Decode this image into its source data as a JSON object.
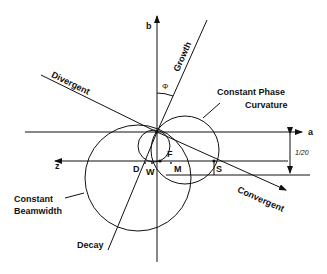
{
  "diagram": {
    "axes": {
      "b": "b",
      "a": "a",
      "z": "z"
    },
    "angle_label": "Φ",
    "lines": {
      "growth": "Growth",
      "divergent": "Divergent",
      "convergent": "Convergent",
      "decay": "Decay"
    },
    "curves": {
      "phase_curvature_line1": "Constant Phase",
      "phase_curvature_line2": "Curvature",
      "beamwidth_line1": "Constant",
      "beamwidth_line2": "Beamwidth"
    },
    "points": {
      "D": "D",
      "W": "W",
      "F": "F",
      "M": "M",
      "S": "S"
    },
    "dimension_label": "1/20"
  }
}
